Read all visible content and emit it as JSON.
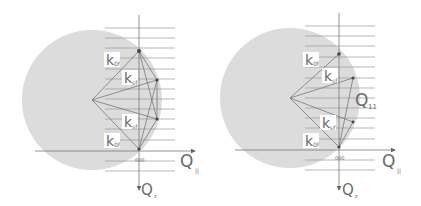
{
  "panels": [
    {
      "id": "left",
      "labels": {
        "k_top": "k",
        "k_top_sub": "0f",
        "k_upper": "k",
        "k_upper_sub": "sf",
        "k_lower": "k",
        "k_lower_sub": "sf",
        "k_bottom": "k",
        "k_bottom_sub": "0f",
        "origin": "000",
        "q_parallel": "Q",
        "q_parallel_sub": "||",
        "q_z": "Q",
        "q_z_sub": "z"
      }
    },
    {
      "id": "right",
      "labels": {
        "k_top": "k",
        "k_top_sub": "0f",
        "k_upper": "k",
        "k_upper_sub": "sf",
        "k_lower": "k",
        "k_lower_sub": "sf",
        "k_bottom": "k",
        "k_bottom_sub": "0f",
        "q_vector": "Q",
        "q_vector_sub": "11",
        "origin": "000",
        "q_parallel": "Q",
        "q_parallel_sub": "||",
        "q_z": "Q",
        "q_z_sub": "z"
      }
    }
  ],
  "colors": {
    "ewald_sphere": "#dcdcdc",
    "lines": "#8a8a8a",
    "vectors": "#777777",
    "text": "#6a6a6a"
  }
}
